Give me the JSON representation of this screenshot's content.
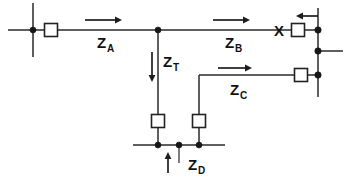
{
  "diagram": {
    "type": "electrical-schematic",
    "canvas": {
      "width": 354,
      "height": 188,
      "background": "#ffffff"
    },
    "stroke_color": "#2a2a2a",
    "node_color": "#161616",
    "box_fill": "#ffffff",
    "labels": [
      {
        "id": "za",
        "base": "Z",
        "sub": "A",
        "x": 97,
        "y": 48,
        "text": "ZA"
      },
      {
        "id": "zb",
        "base": "Z",
        "sub": "B",
        "x": 225,
        "y": 48,
        "text": "ZB"
      },
      {
        "id": "zt",
        "base": "Z",
        "sub": "T",
        "x": 163,
        "y": 67,
        "text": "ZT"
      },
      {
        "id": "zc",
        "base": "Z",
        "sub": "C",
        "x": 230,
        "y": 95,
        "text": "ZC"
      },
      {
        "id": "zd",
        "base": "Z",
        "sub": "D",
        "x": 188,
        "y": 170,
        "text": "ZD"
      }
    ],
    "fault_marker": {
      "id": "fault-x",
      "text": "X",
      "x": 274,
      "y": 36
    },
    "impedance_boxes": [
      {
        "id": "box-source-left",
        "cx": 51,
        "cy": 30,
        "w": 13,
        "h": 13
      },
      {
        "id": "box-zb-right",
        "cx": 298,
        "cy": 30,
        "w": 13,
        "h": 13
      },
      {
        "id": "box-zc-right",
        "cx": 301,
        "cy": 75,
        "w": 13,
        "h": 13
      },
      {
        "id": "box-zt-bottom",
        "cx": 158,
        "cy": 121,
        "w": 13,
        "h": 13
      },
      {
        "id": "box-zc-bottom",
        "cx": 199,
        "cy": 121,
        "w": 13,
        "h": 13
      }
    ],
    "node_dots": [
      {
        "id": "node-left-bus",
        "cx": 33,
        "cy": 30,
        "r": 3.0
      },
      {
        "id": "node-center-tap",
        "cx": 158,
        "cy": 30,
        "r": 3.0
      },
      {
        "id": "node-right-top",
        "cx": 318,
        "cy": 30,
        "r": 3.2
      },
      {
        "id": "node-right-mid",
        "cx": 318,
        "cy": 51,
        "r": 3.2
      },
      {
        "id": "node-right-low",
        "cx": 318,
        "cy": 75,
        "r": 3.2
      },
      {
        "id": "node-bottom-a",
        "cx": 158,
        "cy": 145,
        "r": 3.0
      },
      {
        "id": "node-bottom-b",
        "cx": 179,
        "cy": 145,
        "r": 3.0
      },
      {
        "id": "node-bottom-c",
        "cx": 199,
        "cy": 145,
        "r": 3.0
      }
    ],
    "wires": [
      {
        "id": "bus-left-vertical",
        "d": "M 33 3 L 33 57"
      },
      {
        "id": "main-line-left",
        "d": "M 8 30 L 44.5 30"
      },
      {
        "id": "segment-za",
        "d": "M 57.5 30 L 158 30"
      },
      {
        "id": "segment-zb",
        "d": "M 158 30 L 291.5 30"
      },
      {
        "id": "segment-zb-to-bus",
        "d": "M 304.5 30 L 318 30"
      },
      {
        "id": "bus-right-vertical",
        "d": "M 318 8 L 318 97"
      },
      {
        "id": "bus-right-stub",
        "d": "M 318 51 L 343 51"
      },
      {
        "id": "branch-zt-vertical",
        "d": "M 158 30 L 158 114.5"
      },
      {
        "id": "leg-zt-to-bottom",
        "d": "M 158 127.5 L 158 145"
      },
      {
        "id": "branch-zc-drop",
        "d": "M 199 75 L 199 114.5"
      },
      {
        "id": "leg-zc-to-bottom",
        "d": "M 199 127.5 L 199 145"
      },
      {
        "id": "segment-zc-horizontal",
        "d": "M 199 75 L 294.5 75"
      },
      {
        "id": "segment-zc-to-bus",
        "d": "M 307.5 75 L 318 75"
      },
      {
        "id": "bottom-bus",
        "d": "M 133 145 L 225 145"
      },
      {
        "id": "bottom-tick",
        "d": "M 179 145 L 179 163"
      }
    ],
    "flow_arrows": [
      {
        "id": "arrow-za",
        "direction": "right",
        "x1": 85,
        "y1": 20,
        "x2": 122,
        "y2": 20
      },
      {
        "id": "arrow-zb",
        "direction": "right",
        "x1": 213,
        "y1": 20,
        "x2": 250,
        "y2": 20
      },
      {
        "id": "arrow-zc",
        "direction": "right",
        "x1": 218,
        "y1": 68,
        "x2": 252,
        "y2": 68
      },
      {
        "id": "arrow-in-right",
        "direction": "left",
        "x1": 318,
        "y1": 16,
        "x2": 296,
        "y2": 16
      },
      {
        "id": "arrow-zt",
        "direction": "down",
        "x1": 152,
        "y1": 52,
        "x2": 152,
        "y2": 82
      },
      {
        "id": "arrow-zd",
        "direction": "up",
        "x1": 168,
        "y1": 173,
        "x2": 168,
        "y2": 152
      }
    ]
  }
}
